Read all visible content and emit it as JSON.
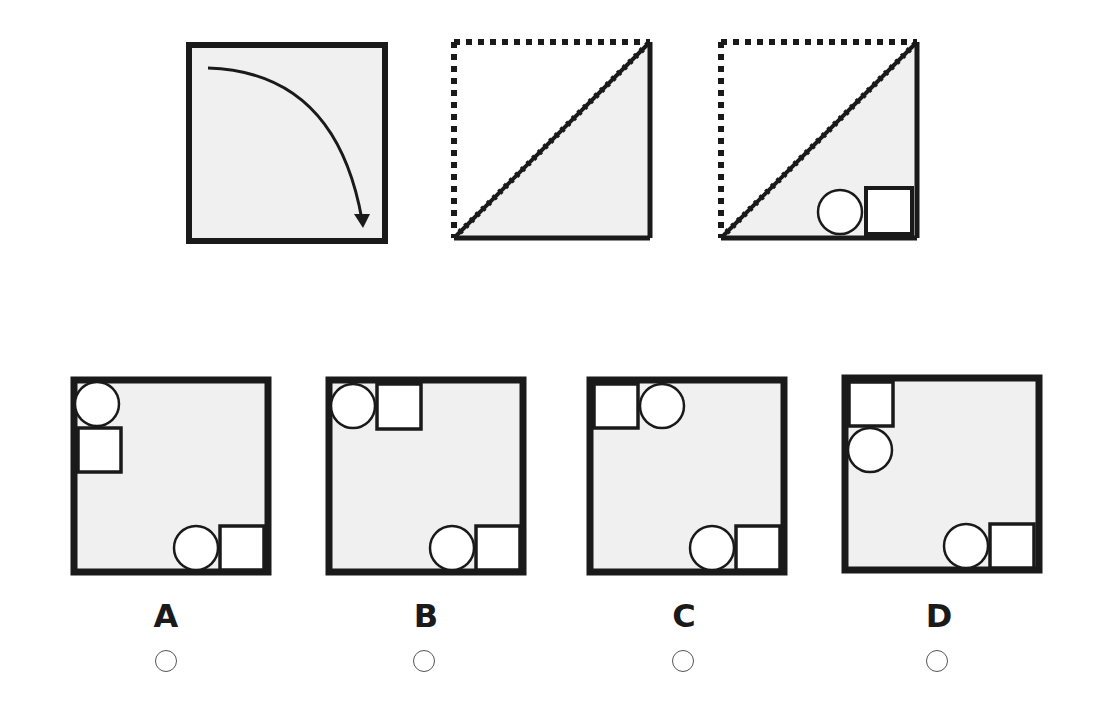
{
  "question": {
    "step1": {
      "description": "Square paper with curved arrow showing fold from top-left toward bottom-right",
      "icon": "fold-arrow-icon"
    },
    "step2": {
      "description": "Paper folded diagonally; top-left triangle shown dotted, bottom-right triangle remains"
    },
    "step3": {
      "description": "Folded triangle with a circle and a square cut out at the bottom-right corner"
    }
  },
  "options": [
    {
      "label": "A",
      "description": "Circle above square at top-left edge; circle and square at bottom-right"
    },
    {
      "label": "B",
      "description": "Circle then square along top edge at top-left; circle and square at bottom-right"
    },
    {
      "label": "C",
      "description": "Square then circle along top edge at top-left; circle and square at bottom-right"
    },
    {
      "label": "D",
      "description": "Square above circle at top-left edge; circle and square at bottom-right"
    }
  ],
  "colors": {
    "paper": "#f0f0f0",
    "stroke": "#1a1a1a",
    "cutout": "#ffffff"
  }
}
